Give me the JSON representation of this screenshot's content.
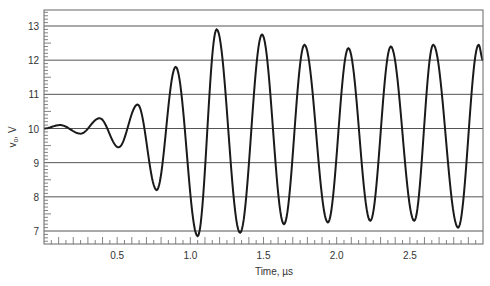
{
  "chart_data": {
    "type": "line",
    "title": "",
    "xlabel": "Time, µs",
    "ylabel": "vₒ, V",
    "ylabel_main": "v",
    "ylabel_sub": "o",
    "ylabel_unit": ", V",
    "xlim": [
      0,
      3.0
    ],
    "ylim": [
      6.6,
      13.5
    ],
    "grid": "horizontal",
    "legend": "none",
    "x_ticks": [
      0.5,
      1.0,
      1.5,
      2.0,
      2.5
    ],
    "x_tick_labels": [
      "0.5",
      "1.0",
      "1.5",
      "2.0",
      "2.5"
    ],
    "y_ticks": [
      7,
      8,
      9,
      10,
      11,
      12,
      13
    ],
    "y_tick_labels": [
      "7",
      "8",
      "9",
      "10",
      "11",
      "12",
      "13"
    ],
    "line_color": "#1a1a1a",
    "grid_color": "#555555",
    "series": [
      {
        "name": "v_o",
        "extrema": [
          {
            "x": 0.0,
            "y": 10.0
          },
          {
            "x": 0.11,
            "y": 10.1
          },
          {
            "x": 0.25,
            "y": 9.85
          },
          {
            "x": 0.38,
            "y": 10.3
          },
          {
            "x": 0.51,
            "y": 9.45
          },
          {
            "x": 0.64,
            "y": 10.7
          },
          {
            "x": 0.77,
            "y": 8.2
          },
          {
            "x": 0.9,
            "y": 11.8
          },
          {
            "x": 1.05,
            "y": 6.85
          },
          {
            "x": 1.18,
            "y": 12.9
          },
          {
            "x": 1.34,
            "y": 6.95
          },
          {
            "x": 1.49,
            "y": 12.75
          },
          {
            "x": 1.64,
            "y": 7.2
          },
          {
            "x": 1.78,
            "y": 12.45
          },
          {
            "x": 1.94,
            "y": 7.25
          },
          {
            "x": 2.08,
            "y": 12.35
          },
          {
            "x": 2.23,
            "y": 7.3
          },
          {
            "x": 2.37,
            "y": 12.4
          },
          {
            "x": 2.53,
            "y": 7.3
          },
          {
            "x": 2.66,
            "y": 12.45
          },
          {
            "x": 2.83,
            "y": 7.1
          },
          {
            "x": 2.97,
            "y": 12.45
          },
          {
            "x": 3.0,
            "y": 12.0
          }
        ]
      }
    ]
  }
}
